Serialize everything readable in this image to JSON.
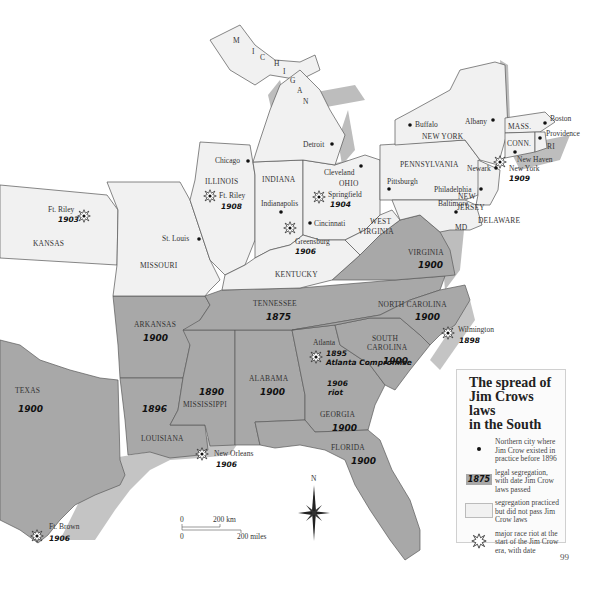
{
  "map": {
    "title": "The spread of Jim Crows laws in the South",
    "title_lines": [
      "The spread of",
      "Jim Crows laws",
      "in the South"
    ],
    "colors": {
      "legal_segregation_fill": "#a8a8a8",
      "practiced_segregation_fill": "#f1f1f1",
      "water_shadow": "#bdbdbd"
    },
    "southern_states": [
      {
        "name": "TEXAS",
        "year": "1900"
      },
      {
        "name": "ARKANSAS",
        "year": "1900"
      },
      {
        "name": "LOUISIANA",
        "year": "1896"
      },
      {
        "name": "MISSISSIPPI",
        "year": "1890"
      },
      {
        "name": "ALABAMA",
        "year": "1900"
      },
      {
        "name": "TENNESSEE",
        "year": "1875"
      },
      {
        "name": "GEORGIA",
        "year": "1900"
      },
      {
        "name": "FLORIDA",
        "year": "1900"
      },
      {
        "name": "SOUTH CAROLINA",
        "year": "1900"
      },
      {
        "name": "NORTH CAROLINA",
        "year": "1900"
      },
      {
        "name": "VIRGINIA",
        "year": "1900"
      }
    ],
    "northern_states": [
      "KANSAS",
      "MISSOURI",
      "ILLINOIS",
      "INDIANA",
      "OHIO",
      "KENTUCKY",
      "WEST VIRGINIA",
      "PENNSYLVANIA",
      "NEW YORK",
      "NEW JERSEY",
      "DELAWARE",
      "MD",
      "MASS.",
      "CONN.",
      "RI",
      "MICHIGAN"
    ],
    "michigan_letters": [
      "M",
      "I",
      "C",
      "H",
      "I",
      "G",
      "A",
      "N"
    ],
    "cities": [
      "Chicago",
      "St. Louis",
      "Indianapolis",
      "Cincinnati",
      "Detroit",
      "Cleveland",
      "Pittsburgh",
      "Buffalo",
      "Albany",
      "Boston",
      "Providence",
      "New Haven",
      "Newark",
      "Philadelphia",
      "Baltimore"
    ],
    "riots": [
      {
        "place": "Ft. Riley",
        "year": "1903"
      },
      {
        "place": "Ft. Riley",
        "year": "1908"
      },
      {
        "place": "Springfield",
        "year": "1904"
      },
      {
        "place": "Greensburg",
        "year": "1906"
      },
      {
        "place": "New York",
        "year": "1909"
      },
      {
        "place": "Wilmington",
        "year": "1898"
      },
      {
        "place": "Atlanta",
        "year": "1895",
        "note": "Atlanta Compromise",
        "note2": "1906",
        "note3": "riot"
      },
      {
        "place": "New Orleans",
        "year": "1906"
      },
      {
        "place": "Ft. Brown",
        "year": "1906"
      }
    ],
    "compass": "N",
    "scale": {
      "km": "200 km",
      "miles": "200 miles",
      "zero": "0"
    }
  },
  "legend": {
    "items": [
      {
        "symbol": "city-dot",
        "text": "Northern city where Jim Crow existed in practice before 1896"
      },
      {
        "symbol": "year-swatch",
        "swatch_label": "1875",
        "text": "legal segregation, with date Jim Crow laws passed"
      },
      {
        "symbol": "light-swatch",
        "text": "segregation practiced but did not pass Jim Crow laws"
      },
      {
        "symbol": "riot-star",
        "text": "major race riot at the start of the Jim Crow era, with date"
      }
    ]
  },
  "page_number": "99"
}
